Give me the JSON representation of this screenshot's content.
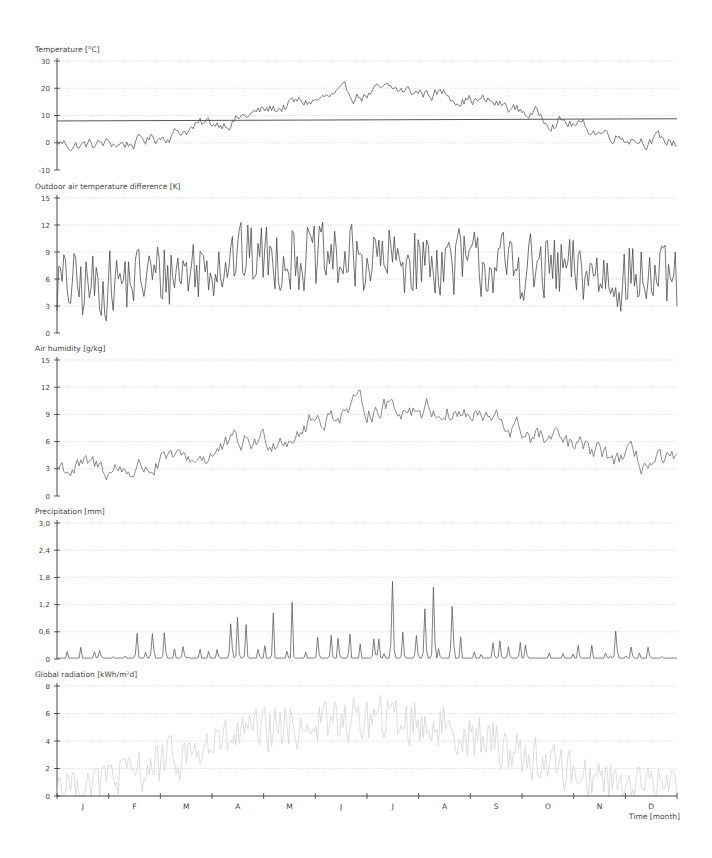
{
  "chart_data": [
    {
      "type": "line",
      "title": "Temperature [°C]",
      "ylabel": "Temperature [°C]",
      "ylim": [
        -10,
        30
      ],
      "yticks": [
        "-10",
        "0",
        "10",
        "20",
        "30"
      ],
      "grid": true,
      "categories": [
        "J",
        "F",
        "M",
        "A",
        "M",
        "J",
        "J",
        "A",
        "S",
        "O",
        "N",
        "D"
      ],
      "monthly_mean": [
        -1,
        0,
        5,
        9,
        14,
        17,
        19,
        18,
        14,
        9,
        4,
        1
      ],
      "monthly_min": [
        -12,
        -10,
        -3,
        2,
        7,
        10,
        12,
        11,
        8,
        2,
        -2,
        -8
      ],
      "monthly_max": [
        7,
        9,
        12,
        15,
        21,
        24,
        25,
        24,
        19,
        16,
        10,
        9
      ],
      "reference_line": {
        "label": "annual mean",
        "start": 8.0,
        "end": 8.8
      },
      "line_color": "#555555",
      "noise": 3.0
    },
    {
      "type": "line",
      "title": "Outdoor air temperature difference [K]",
      "ylabel": "Outdoor air temperature difference [K]",
      "ylim": [
        0,
        15
      ],
      "yticks": [
        "0",
        "3",
        "6",
        "9",
        "12",
        "15"
      ],
      "grid": true,
      "categories": [
        "J",
        "F",
        "M",
        "A",
        "M",
        "J",
        "J",
        "A",
        "S",
        "O",
        "N",
        "D"
      ],
      "monthly_mean": [
        5,
        6,
        7,
        8.5,
        8.5,
        8,
        8,
        8,
        7.5,
        7,
        6.5,
        6
      ],
      "monthly_min": [
        0,
        0.3,
        2.5,
        3,
        3,
        3,
        3,
        3,
        2,
        1,
        0.5,
        0.3
      ],
      "monthly_max": [
        11.5,
        15,
        13.5,
        15,
        15,
        15,
        15,
        15,
        14.5,
        14,
        11.5,
        12.5
      ],
      "line_color": "#444444",
      "noise": 4.0
    },
    {
      "type": "line",
      "title": "Air humidity [g/kg]",
      "ylabel": "Air humidity [g/kg]",
      "ylim": [
        0,
        15
      ],
      "yticks": [
        "0",
        "3",
        "6",
        "9",
        "12",
        "15"
      ],
      "grid": true,
      "categories": [
        "J",
        "F",
        "M",
        "A",
        "M",
        "J",
        "J",
        "A",
        "S",
        "O",
        "N",
        "D"
      ],
      "monthly_mean": [
        3,
        3,
        4,
        5.5,
        7,
        9.5,
        10,
        9.5,
        8,
        6,
        4.5,
        3.5
      ],
      "monthly_min": [
        1.5,
        1.8,
        2.5,
        3.5,
        5,
        5.5,
        6,
        6,
        5,
        3.5,
        2.8,
        2.2
      ],
      "monthly_max": [
        4.8,
        4.5,
        5.2,
        9.3,
        9,
        14.5,
        14.5,
        12.2,
        10,
        10,
        6.5,
        6
      ],
      "line_color": "#666666",
      "noise": 1.5
    },
    {
      "type": "line",
      "title": "Precipitation [mm]",
      "ylabel": "Precipitation [mm]",
      "ylim": [
        0,
        3.0
      ],
      "yticks": [
        "0",
        "0,6",
        "1,2",
        "1,8",
        "2,4",
        "3,0"
      ],
      "grid": true,
      "categories": [
        "J",
        "F",
        "M",
        "A",
        "M",
        "J",
        "J",
        "A",
        "S",
        "O",
        "N",
        "D"
      ],
      "monthly_peak": [
        0.75,
        0.75,
        0.8,
        1.1,
        1.5,
        1.75,
        1.95,
        1.75,
        1.3,
        1.1,
        0.85,
        0.8
      ],
      "line_color": "#555555"
    },
    {
      "type": "line",
      "title": "Global radiation [kWh/m²d]",
      "ylabel": "Global radiation [kWh/m²d]",
      "ylim": [
        0,
        8
      ],
      "yticks": [
        "0",
        "2",
        "4",
        "6",
        "8"
      ],
      "grid": true,
      "categories": [
        "J",
        "F",
        "M",
        "A",
        "M",
        "J",
        "J",
        "A",
        "S",
        "O",
        "N",
        "D"
      ],
      "monthly_mean": [
        1,
        1.7,
        3,
        4.3,
        5,
        5.5,
        5.6,
        5,
        3.8,
        2.3,
        1.3,
        0.9
      ],
      "monthly_max": [
        1.6,
        3,
        5,
        6.5,
        7.5,
        8.3,
        8.3,
        7.5,
        6,
        4,
        2.3,
        2
      ],
      "line_color": "#d4d4d4",
      "noise": 1.8
    }
  ],
  "x_axis": {
    "label": "Time [month]",
    "months": [
      "J",
      "F",
      "M",
      "A",
      "M",
      "J",
      "J",
      "A",
      "S",
      "O",
      "N",
      "D"
    ],
    "days": 365
  },
  "colors": {
    "grid": "#cccccc",
    "axis": "#333333",
    "text": "#444444"
  }
}
